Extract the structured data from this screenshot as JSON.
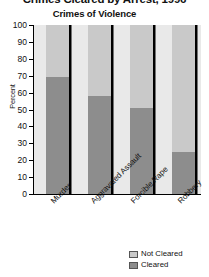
{
  "chart_data": {
    "type": "bar",
    "subtype": "stacked-bar",
    "title": "Crimes Cleared by Arrest, 1996",
    "subtitle": "Crimes of Violence",
    "categories": [
      "Murder",
      "Aggravated Assault",
      "Forcible Rape",
      "Robbery"
    ],
    "series": [
      {
        "name": "Not Cleared",
        "values": [
          31,
          42,
          49,
          75
        ],
        "color": "#c9c9c9"
      },
      {
        "name": "Cleared",
        "values": [
          69,
          58,
          51,
          25
        ],
        "color": "#8d8d8d"
      }
    ],
    "xlabel": "",
    "ylabel": "Percent",
    "ylim": [
      0,
      100
    ],
    "y_ticks": [
      0,
      10,
      20,
      30,
      40,
      50,
      60,
      70,
      80,
      90,
      100
    ],
    "grid": false,
    "legend_position": "bottom-right",
    "stack_total": 100
  },
  "legend": {
    "items": [
      {
        "label": "Not Cleared",
        "color": "#c9c9c9"
      },
      {
        "label": "Cleared",
        "color": "#8d8d8d"
      }
    ]
  }
}
